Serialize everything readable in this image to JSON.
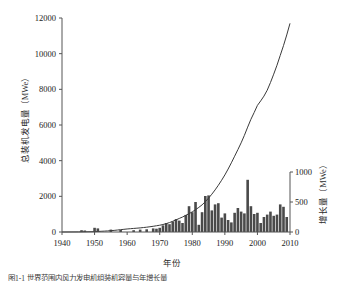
{
  "figure": {
    "caption": "图1-1 世界范围内风力发电机组装机容量与年增长量"
  },
  "axis_titles": {
    "left": "总装机发电量（MWe）",
    "right": "增长量（MWe）",
    "x": "年份"
  },
  "chart_data": {
    "type": "line",
    "title": "",
    "xlabel": "年份",
    "ylabel": "总装机发电量（MWe）",
    "y2label": "增长量（MWe）",
    "xlim": [
      1940,
      2010
    ],
    "ylim": [
      0,
      12000
    ],
    "y2lim": [
      0,
      1000
    ],
    "xticks": [
      1940,
      1950,
      1960,
      1970,
      1980,
      1990,
      2000,
      2010
    ],
    "yticks": [
      0,
      2000,
      4000,
      6000,
      8000,
      10000,
      12000
    ],
    "y2ticks": [
      0,
      500,
      1000
    ],
    "grid": false,
    "legend": "none",
    "colors": {
      "line": "#3a3a3a",
      "bar": "#4a4a4a",
      "axis": "#555555"
    },
    "series": [
      {
        "name": "总装机发电量",
        "type": "line",
        "axis": "left",
        "x": [
          1940,
          1945,
          1950,
          1951,
          1952,
          1953,
          1954,
          1955,
          1956,
          1957,
          1958,
          1959,
          1960,
          1961,
          1962,
          1963,
          1964,
          1965,
          1966,
          1967,
          1968,
          1969,
          1970,
          1971,
          1972,
          1973,
          1974,
          1975,
          1976,
          1977,
          1978,
          1979,
          1980,
          1981,
          1982,
          1983,
          1984,
          1985,
          1986,
          1987,
          1988,
          1989,
          1990,
          1991,
          1992,
          1993,
          1994,
          1995,
          1996,
          1997,
          1998,
          1999,
          2000,
          2001,
          2002,
          2003,
          2004,
          2005,
          2006,
          2007,
          2008,
          2009,
          2010
        ],
        "y": [
          0,
          5,
          20,
          30,
          40,
          50,
          60,
          75,
          90,
          110,
          130,
          150,
          170,
          185,
          200,
          215,
          230,
          250,
          270,
          295,
          320,
          350,
          380,
          420,
          470,
          530,
          600,
          680,
          760,
          840,
          930,
          1030,
          1130,
          1250,
          1380,
          1520,
          1700,
          1900,
          2120,
          2360,
          2620,
          2900,
          3200,
          3530,
          3880,
          4250,
          4620,
          5000,
          5420,
          5880,
          6320,
          6700,
          7100,
          7350,
          7620,
          7950,
          8380,
          8850,
          9350,
          9900,
          10450,
          11050,
          11700
        ]
      },
      {
        "name": "增长量",
        "type": "bar",
        "axis": "right",
        "x": [
          1946,
          1947,
          1950,
          1951,
          1955,
          1958,
          1962,
          1964,
          1966,
          1968,
          1969,
          1970,
          1971,
          1972,
          1973,
          1974,
          1975,
          1976,
          1977,
          1978,
          1979,
          1980,
          1981,
          1982,
          1983,
          1984,
          1985,
          1986,
          1987,
          1988,
          1989,
          1990,
          1991,
          1992,
          1993,
          1994,
          1995,
          1996,
          1997,
          1998,
          1999,
          2000,
          2001,
          2002,
          2003,
          2004,
          2005,
          2006,
          2007,
          2008,
          2009
        ],
        "y": [
          30,
          25,
          70,
          60,
          40,
          35,
          30,
          40,
          45,
          60,
          55,
          70,
          110,
          150,
          130,
          175,
          215,
          190,
          150,
          285,
          430,
          330,
          500,
          120,
          330,
          600,
          610,
          360,
          460,
          480,
          240,
          310,
          200,
          160,
          320,
          400,
          340,
          310,
          870,
          430,
          300,
          320,
          150,
          250,
          290,
          340,
          270,
          290,
          460,
          420,
          250
        ]
      }
    ]
  }
}
